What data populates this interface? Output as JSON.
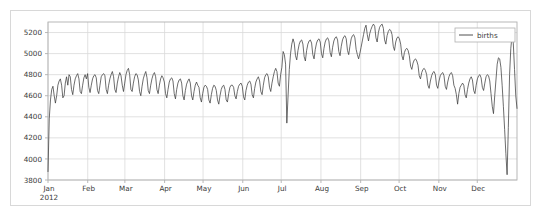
{
  "figure": {
    "background_color": "#ffffff",
    "border_color": "#d8d8d8",
    "plot_frame_color": "#b0b0b0",
    "grid_color": "#d9d9d9",
    "line_color": "#3c3c3c",
    "text_color": "#3a3a3a"
  },
  "legend": {
    "position": "top-right",
    "entries": [
      {
        "label": "births",
        "color": "#3c3c3c",
        "marker": "line"
      }
    ]
  },
  "axes": {
    "y_ticks": [
      "3800",
      "4000",
      "4200",
      "4400",
      "4600",
      "4800",
      "5000",
      "5200"
    ],
    "x_ticks": [
      "Jan",
      "Feb",
      "Mar",
      "Apr",
      "May",
      "Jun",
      "Jul",
      "Aug",
      "Sep",
      "Oct",
      "Nov",
      "Dec"
    ],
    "x_year_label": "2012"
  },
  "chart_data": {
    "type": "line",
    "title": "",
    "xlabel": "",
    "ylabel": "",
    "ylim": [
      3800,
      5300
    ],
    "xlim": [
      0,
      366
    ],
    "grid": true,
    "legend_position": "upper right",
    "y_ticks": [
      3800,
      4000,
      4200,
      4400,
      4600,
      4800,
      5000,
      5200
    ],
    "x_tick_labels": [
      "Jan\n2012",
      "Feb",
      "Mar",
      "Apr",
      "May",
      "Jun",
      "Jul",
      "Aug",
      "Sep",
      "Oct",
      "Nov",
      "Dec"
    ],
    "x_tick_positions": [
      0,
      31,
      60,
      91,
      121,
      152,
      182,
      213,
      244,
      274,
      305,
      335
    ],
    "series": [
      {
        "name": "births",
        "color": "#3c3c3c",
        "x_unit": "day-of-year-2012",
        "values": [
          3880,
          4380,
          4560,
          4660,
          4690,
          4600,
          4530,
          4600,
          4700,
          4740,
          4760,
          4700,
          4580,
          4600,
          4720,
          4780,
          4700,
          4800,
          4780,
          4660,
          4610,
          4700,
          4760,
          4790,
          4810,
          4760,
          4640,
          4620,
          4700,
          4770,
          4800,
          4760,
          4810,
          4680,
          4630,
          4700,
          4760,
          4790,
          4800,
          4770,
          4650,
          4620,
          4700,
          4780,
          4800,
          4810,
          4790,
          4660,
          4620,
          4700,
          4760,
          4800,
          4830,
          4780,
          4660,
          4630,
          4720,
          4780,
          4820,
          4790,
          4700,
          4640,
          4720,
          4800,
          4840,
          4860,
          4800,
          4660,
          4640,
          4720,
          4780,
          4810,
          4800,
          4750,
          4640,
          4600,
          4690,
          4760,
          4800,
          4830,
          4770,
          4650,
          4620,
          4700,
          4760,
          4800,
          4820,
          4780,
          4660,
          4620,
          4700,
          4760,
          4790,
          4770,
          4730,
          4620,
          4580,
          4660,
          4730,
          4760,
          4770,
          4740,
          4620,
          4570,
          4660,
          4720,
          4750,
          4760,
          4720,
          4600,
          4560,
          4650,
          4710,
          4740,
          4760,
          4720,
          4600,
          4560,
          4640,
          4700,
          4730,
          4700,
          4680,
          4580,
          4540,
          4620,
          4680,
          4700,
          4690,
          4660,
          4560,
          4530,
          4610,
          4670,
          4700,
          4690,
          4650,
          4560,
          4520,
          4600,
          4660,
          4690,
          4700,
          4660,
          4560,
          4540,
          4620,
          4680,
          4700,
          4700,
          4680,
          4600,
          4570,
          4640,
          4690,
          4710,
          4720,
          4690,
          4590,
          4560,
          4650,
          4700,
          4730,
          4740,
          4710,
          4610,
          4580,
          4670,
          4730,
          4760,
          4780,
          4740,
          4640,
          4610,
          4700,
          4770,
          4800,
          4810,
          4780,
          4680,
          4640,
          4720,
          4780,
          4830,
          4860,
          4830,
          4720,
          4690,
          4800,
          4870,
          5020,
          4990,
          4900,
          4340,
          4600,
          4850,
          5000,
          5090,
          5140,
          5100,
          4980,
          4940,
          5030,
          5090,
          5120,
          5130,
          5090,
          4970,
          4930,
          5030,
          5090,
          5120,
          5130,
          5100,
          4990,
          4950,
          5040,
          5100,
          5130,
          5140,
          5110,
          5000,
          4960,
          5050,
          5110,
          5140,
          5150,
          5120,
          5010,
          4970,
          5060,
          5120,
          5150,
          5160,
          5130,
          5020,
          4980,
          5070,
          5130,
          5160,
          5170,
          5140,
          5030,
          4990,
          5070,
          5140,
          5170,
          5180,
          5150,
          5040,
          4990,
          4950,
          5000,
          5060,
          5120,
          5180,
          5240,
          5270,
          5180,
          5120,
          5190,
          5230,
          5260,
          5280,
          5260,
          5150,
          5110,
          5200,
          5250,
          5270,
          5280,
          5240,
          5130,
          5090,
          5170,
          5210,
          5230,
          5220,
          5180,
          5070,
          5030,
          5110,
          5150,
          5160,
          5140,
          5090,
          4980,
          4940,
          5010,
          5040,
          5050,
          5030,
          4980,
          4880,
          4850,
          4910,
          4940,
          4950,
          4930,
          4890,
          4790,
          4760,
          4820,
          4850,
          4860,
          4840,
          4800,
          4700,
          4670,
          4740,
          4790,
          4820,
          4830,
          4800,
          4700,
          4670,
          4740,
          4790,
          4810,
          4820,
          4790,
          4690,
          4660,
          4730,
          4780,
          4810,
          4820,
          4790,
          4700,
          4670,
          4610,
          4520,
          4620,
          4680,
          4700,
          4720,
          4700,
          4610,
          4580,
          4660,
          4720,
          4760,
          4780,
          4750,
          4650,
          4620,
          4700,
          4760,
          4790,
          4800,
          4770,
          4680,
          4650,
          4720,
          4780,
          4800,
          4790,
          4740,
          4620,
          4500,
          4430,
          4600,
          4750,
          4900,
          4960,
          4950,
          4870,
          4700,
          4500,
          4280,
          4050,
          3850,
          4300,
          4800,
          5050,
          5170,
          5100,
          4850,
          4600,
          4480
        ]
      }
    ],
    "annotations": [
      {
        "label": "New Year's Day dip",
        "x": 1,
        "y": 3880
      },
      {
        "label": "Independence Day dip",
        "x": 186,
        "y": 4340
      },
      {
        "label": "September peak",
        "x": 256,
        "y": 5280
      },
      {
        "label": "Thanksgiving dip",
        "x": 327,
        "y": 4430
      },
      {
        "label": "Christmas dip",
        "x": 360,
        "y": 3850
      }
    ]
  }
}
